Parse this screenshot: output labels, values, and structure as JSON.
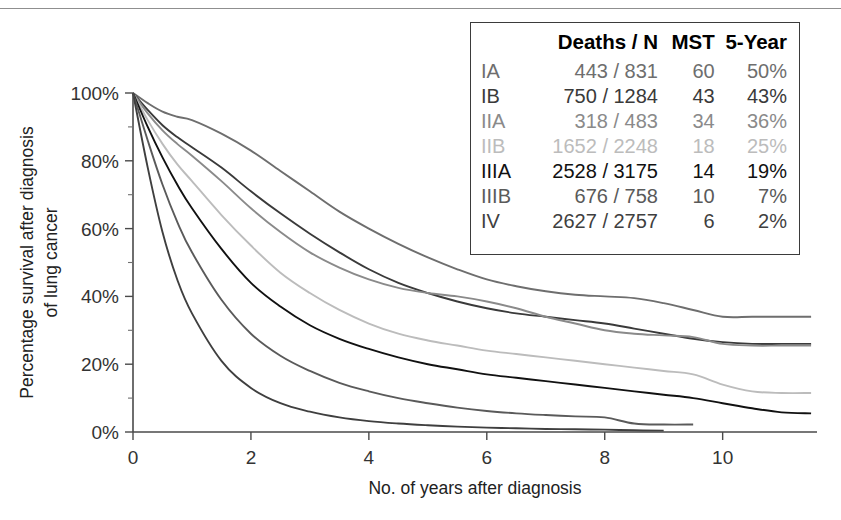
{
  "chart_data": {
    "type": "line",
    "title": "",
    "xlabel": "No. of years after diagnosis",
    "ylabel_line1": "Percentage survival after diagnosis",
    "ylabel_line2": "of lung cancer",
    "xlim": [
      0,
      11.6
    ],
    "ylim": [
      0,
      100
    ],
    "xticks": [
      0,
      2,
      4,
      6,
      8,
      10
    ],
    "xticklabels": [
      "0",
      "2",
      "4",
      "6",
      "8",
      "10"
    ],
    "yticks": [
      0,
      20,
      40,
      60,
      80,
      100
    ],
    "yticklabels": [
      "0%",
      "20%",
      "40%",
      "60%",
      "80%",
      "100%"
    ],
    "y_minor_ticks": [
      10,
      30,
      50,
      70,
      90
    ],
    "grid": false,
    "legend_position": "top-right-box",
    "x": [
      0,
      0.25,
      0.5,
      0.75,
      1,
      1.5,
      2,
      2.5,
      3,
      3.5,
      4,
      4.5,
      5,
      5.5,
      6,
      6.5,
      7,
      7.5,
      8,
      8.5,
      9,
      9.5,
      10,
      10.5,
      11,
      11.5
    ],
    "series": [
      {
        "name": "IA",
        "color": "#6e6e6e",
        "values": [
          100,
          97,
          94.5,
          93,
          92,
          88,
          83,
          77,
          71,
          65,
          60,
          55.5,
          51.5,
          48,
          45,
          43,
          41.5,
          40.5,
          40,
          39.5,
          38,
          36,
          34,
          34,
          34,
          34
        ],
        "final_value": 34
      },
      {
        "name": "IB",
        "color": "#3a3a3a",
        "values": [
          100,
          95,
          90.5,
          87,
          84,
          78,
          71,
          64.5,
          58.5,
          53,
          48,
          44,
          41,
          38.5,
          36.5,
          35,
          34,
          33,
          32,
          30.5,
          29,
          27.5,
          26.5,
          26,
          26,
          26
        ],
        "final_value": 26
      },
      {
        "name": "IIA",
        "color": "#8a8a8a",
        "values": [
          100,
          94,
          89,
          85,
          81.5,
          74,
          66,
          59,
          53,
          48.5,
          45,
          42.5,
          41,
          40,
          38.5,
          36.5,
          34,
          32,
          30,
          29,
          28.5,
          28,
          26,
          25.5,
          25.5,
          25.5
        ],
        "final_value": 25.5
      },
      {
        "name": "IIB",
        "color": "#bcbcbc",
        "values": [
          100,
          92,
          85,
          79,
          74,
          64,
          55,
          47,
          41,
          36,
          32,
          29,
          27,
          25.5,
          24,
          23,
          22,
          21,
          20,
          19,
          18,
          17,
          14,
          12,
          11.5,
          11.5
        ],
        "final_value": 11.5
      },
      {
        "name": "IIIA",
        "color": "#111111",
        "values": [
          100,
          90,
          81,
          73,
          66,
          54,
          44,
          37,
          31.5,
          27.5,
          24.5,
          22,
          20,
          18.5,
          17,
          16,
          15,
          14,
          13,
          12,
          11,
          10,
          8.5,
          7,
          5.8,
          5.5
        ],
        "final_value": 5.5
      },
      {
        "name": "IIIB",
        "color": "#5a5a5a",
        "values": [
          100,
          86,
          73,
          62,
          53,
          39,
          29,
          22.5,
          18,
          14.5,
          12,
          10,
          8.5,
          7.2,
          6.2,
          5.5,
          5,
          4.6,
          4.3,
          2.5,
          2.2,
          2.2,
          null,
          null,
          null,
          null
        ],
        "final_value": 2.2
      },
      {
        "name": "IV",
        "color": "#3f3f3f",
        "values": [
          100,
          78,
          59,
          45,
          35,
          21,
          13,
          8.5,
          6,
          4.3,
          3.2,
          2.5,
          2,
          1.6,
          1.3,
          1.1,
          0.9,
          0.8,
          0.7,
          0.5,
          0.4,
          null,
          null,
          null,
          null,
          null
        ],
        "final_value": 0.4
      }
    ]
  },
  "legend": {
    "headers": {
      "stage": "",
      "deaths": "Deaths / N",
      "mst": "MST",
      "five_year": "5-Year"
    },
    "rows": [
      {
        "stage": "IA",
        "deaths": "443 / 831",
        "mst": "60",
        "five_year": "50%",
        "color": "#6e6e6e"
      },
      {
        "stage": "IB",
        "deaths": "750 / 1284",
        "mst": "43",
        "five_year": "43%",
        "color": "#3a3a3a"
      },
      {
        "stage": "IIA",
        "deaths": "318 / 483",
        "mst": "34",
        "five_year": "36%",
        "color": "#8a8a8a"
      },
      {
        "stage": "IIB",
        "deaths": "1652 / 2248",
        "mst": "18",
        "five_year": "25%",
        "color": "#bcbcbc"
      },
      {
        "stage": "IIIA",
        "deaths": "2528 / 3175",
        "mst": "14",
        "five_year": "19%",
        "color": "#111111"
      },
      {
        "stage": "IIIB",
        "deaths": "676 / 758",
        "mst": "10",
        "five_year": "7%",
        "color": "#5a5a5a"
      },
      {
        "stage": "IV",
        "deaths": "2627 / 2757",
        "mst": "6",
        "five_year": "2%",
        "color": "#3f3f3f"
      }
    ]
  }
}
